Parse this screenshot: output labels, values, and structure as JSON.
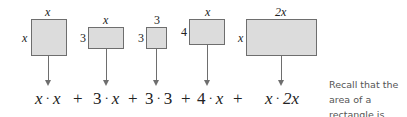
{
  "figure": {
    "rectangles": [
      {
        "id": "r1",
        "top_label": "x",
        "side_label": "x",
        "top_italic": true,
        "side_italic": true
      },
      {
        "id": "r2",
        "top_label": "x",
        "side_label": "3",
        "top_italic": true,
        "side_italic": false
      },
      {
        "id": "r3",
        "top_label": "3",
        "side_label": "3",
        "top_italic": false,
        "side_italic": false
      },
      {
        "id": "r4",
        "top_label": "x",
        "side_label": "4",
        "top_italic": true,
        "side_italic": false
      },
      {
        "id": "r5",
        "top_label": "2x",
        "side_label": "x",
        "top_italic": true,
        "side_italic": true
      }
    ],
    "terms": [
      {
        "left": "x",
        "op": "·",
        "right": "x"
      },
      {
        "left": "3",
        "op": "·",
        "right": "x"
      },
      {
        "left": "3",
        "op": "·",
        "right": "3"
      },
      {
        "left": "4",
        "op": "·",
        "right": "x"
      },
      {
        "left": "x",
        "op": "·",
        "right": "2x"
      }
    ],
    "plus_sign": "+",
    "note": "Recall that the area of a rectangle is length times width.",
    "colors": {
      "fill": "#dcdcdc",
      "stroke": "#6e6e6e",
      "text": "#222222",
      "note": "#555555"
    }
  }
}
